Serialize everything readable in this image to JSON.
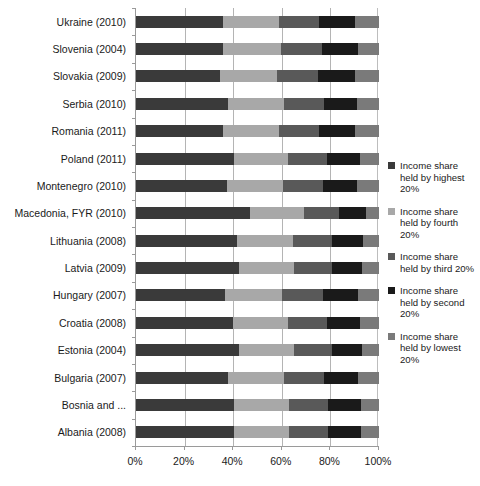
{
  "chart_data": {
    "type": "bar",
    "subtype": "horizontal-100-percent-stacked",
    "title": "",
    "xlabel": "",
    "ylabel": "",
    "xlim": [
      0,
      100
    ],
    "xticks": [
      0,
      20,
      40,
      60,
      80,
      100
    ],
    "xticklabels": [
      "0%",
      "20%",
      "40%",
      "60%",
      "80%",
      "100%"
    ],
    "grid": true,
    "grid_axis": "x",
    "legend_position": "right",
    "categories": [
      "Ukraine (2010)",
      "Slovenia (2004)",
      "Slovakia (2009)",
      "Serbia (2010)",
      "Romania (2011)",
      "Poland (2011)",
      "Montenegro (2010)",
      "Macedonia, FYR (2010)",
      "Lithuania (2008)",
      "Latvia (2009)",
      "Hungary (2007)",
      "Croatia (2008)",
      "Estonia (2004)",
      "Bulgaria (2007)",
      "Bosnia and ...",
      "Albania (2008)"
    ],
    "series": [
      {
        "name": "Income share held by highest 20%",
        "color": "#3a3a3a",
        "values": [
          36.0,
          35.7,
          34.5,
          38.0,
          36.0,
          40.2,
          37.5,
          47.0,
          41.5,
          42.5,
          36.5,
          40.0,
          42.5,
          38.0,
          40.5,
          40.5
        ]
      },
      {
        "name": "Income share held by fourth 20%",
        "color": "#a8a8a8",
        "values": [
          23.0,
          24.0,
          23.5,
          23.0,
          23.0,
          22.5,
          23.0,
          22.0,
          23.0,
          22.5,
          23.5,
          22.5,
          22.5,
          23.0,
          22.5,
          22.5
        ]
      },
      {
        "name": "Income share held by third 20%",
        "color": "#595959",
        "values": [
          16.5,
          17.0,
          17.0,
          16.5,
          16.5,
          16.0,
          16.5,
          14.5,
          16.0,
          15.5,
          17.0,
          16.0,
          15.5,
          16.5,
          16.0,
          16.0
        ]
      },
      {
        "name": "Income share held by second 20%",
        "color": "#1a1a1a",
        "values": [
          14.5,
          14.5,
          15.0,
          13.5,
          14.5,
          13.5,
          14.0,
          11.0,
          13.0,
          12.5,
          14.5,
          13.5,
          12.5,
          14.0,
          13.5,
          13.5
        ]
      },
      {
        "name": "Income share held by lowest 20%",
        "color": "#7a7a7a",
        "values": [
          10.0,
          8.8,
          10.0,
          9.0,
          10.0,
          7.8,
          9.0,
          5.5,
          6.5,
          7.0,
          8.5,
          8.0,
          7.0,
          8.5,
          7.5,
          7.5
        ]
      }
    ]
  },
  "legend": {
    "items": [
      {
        "label": "Income share held by highest 20%",
        "color": "#3a3a3a"
      },
      {
        "label": "Income share held by fourth 20%",
        "color": "#a8a8a8"
      },
      {
        "label": "Income share held by third 20%",
        "color": "#595959"
      },
      {
        "label": "Income share held by second 20%",
        "color": "#1a1a1a"
      },
      {
        "label": "Income share held by lowest 20%",
        "color": "#7a7a7a"
      }
    ]
  }
}
